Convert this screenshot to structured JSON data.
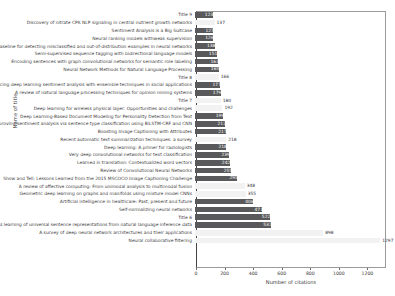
{
  "chart_data": {
    "type": "bar",
    "orientation": "horizontal",
    "title": "",
    "xlabel": "Number of citations",
    "ylabel": "Name of title",
    "xlim": [
      0,
      1330
    ],
    "xticks": [
      0,
      200,
      400,
      600,
      800,
      1000,
      1200
    ],
    "grid": false,
    "legend": null,
    "bar_colors": {
      "dark": "#59595b",
      "light": "#f2f2f2"
    },
    "categories": [
      "Discovery of nitrate CPK NLP signaling in central nutrient growth networks",
      "Sentiment Analysis is a Big Suitcase",
      "Neural ranking models withweak supervision",
      "A baseline for detecting misclassified and out-of-distribution examples in neural networks",
      "Semi-supervised sequence tagging with bidirectional language models",
      "Encoding sentences with graph convolutional networks for semantic role labeling",
      "Neural Network Methods for Natural Language Processing",
      "Title 8",
      "Enhancing deep learning sentiment analysis with ensemble techniques in social applications",
      "A review of natural language processing techniques for opinion mining systems",
      "Title 7",
      "Deep learning for wireless physical layer: Opportunities and challenges",
      "Deep Learning-Based Document Modeling for Personality Detection from Text",
      "Improving sentiment analysis via sentence type classification using BiLSTM-CRF and CNN",
      "Boosting Image Captioning with Attributes",
      "Recent automatic text summarization techniques: a survey",
      "Deep learning: A primer for radiologists",
      "Very deep convolutional networks for text classification",
      "Learned in translation: Contextualized word vectors",
      "Review of Convolutional Neural Networks",
      "Show and Tell: Lessons Learned from the 2015 MSCOCO Image Captioning Challenge",
      "A review of affective computing: From unimodal analysis to multimodal fusion",
      "Geometric deep learning on graphs and manifolds using mixture model CNNs",
      "Artificial intelligence in healthcare: Past, present and future",
      "Self-normalizing neural networks",
      "Title 6",
      "Supervised learning of universal sentence representations from natural language inference data",
      "A survey of deep neural network architectures and their applications",
      "Neural collaborative filtering"
    ],
    "values": [
      123,
      137,
      127,
      126,
      138,
      151,
      163,
      166,
      177,
      179,
      180,
      192,
      199,
      212,
      217,
      218,
      218,
      239,
      242,
      255,
      295,
      348,
      355,
      406,
      471,
      522,
      532,
      898,
      1297
    ],
    "top_label": "Title 9",
    "top_value": 123,
    "bars": [
      {
        "label": "Title 9",
        "value": 123,
        "style": "dark",
        "inside": true
      },
      {
        "label": "Discovery of nitrate CPK NLP signaling in central nutrient growth networks",
        "value": 137,
        "style": "light",
        "inside": false
      },
      {
        "label": "Sentiment Analysis is a Big Suitcase",
        "value": 127,
        "style": "dark",
        "inside": true
      },
      {
        "label": "Neural ranking models withweak supervision",
        "value": 126,
        "style": "dark",
        "inside": true
      },
      {
        "label": "A baseline for detecting misclassified and out-of-distribution examples in neural networks",
        "value": 138,
        "style": "dark",
        "inside": true
      },
      {
        "label": "Semi-supervised sequence tagging with bidirectional language models",
        "value": 151,
        "style": "dark",
        "inside": true
      },
      {
        "label": "Encoding sentences with graph convolutional networks for semantic role labeling",
        "value": 163,
        "style": "dark",
        "inside": true
      },
      {
        "label": "Neural Network Methods for Natural Language Processing",
        "value": 165,
        "style": "dark",
        "inside": true
      },
      {
        "label": "Title 8",
        "value": 166,
        "style": "light",
        "inside": false
      },
      {
        "label": "Enhancing deep learning sentiment analysis with ensemble techniques in social applications",
        "value": 177,
        "style": "dark",
        "inside": true
      },
      {
        "label": "A review of natural language processing techniques for opinion mining systems",
        "value": 179,
        "style": "dark",
        "inside": true
      },
      {
        "label": "Title 7",
        "value": 180,
        "style": "light",
        "inside": false
      },
      {
        "label": "Deep learning for wireless physical layer: Opportunities and challenges",
        "value": 192,
        "style": "light",
        "inside": false
      },
      {
        "label": "Deep Learning-Based Document Modeling for Personality Detection from Text",
        "value": 199,
        "style": "dark",
        "inside": true
      },
      {
        "label": "Improving sentiment analysis via sentence type classification using BiLSTM-CRF and CNN",
        "value": 212,
        "style": "dark",
        "inside": true
      },
      {
        "label": "Boosting Image Captioning with Attributes",
        "value": 217,
        "style": "dark",
        "inside": true
      },
      {
        "label": "Recent automatic text summarization techniques: a survey",
        "value": 218,
        "style": "light",
        "inside": false
      },
      {
        "label": "Deep learning: A primer for radiologists",
        "value": 218,
        "style": "dark",
        "inside": true
      },
      {
        "label": "Very deep convolutional networks for text classification",
        "value": 239,
        "style": "dark",
        "inside": true
      },
      {
        "label": "Learned in translation: Contextualized word vectors",
        "value": 242,
        "style": "dark",
        "inside": true
      },
      {
        "label": "Review of Convolutional Neural Networks",
        "value": 255,
        "style": "dark",
        "inside": true
      },
      {
        "label": "Show and Tell: Lessons Learned from the 2015 MSCOCO Image Captioning Challenge",
        "value": 295,
        "style": "dark",
        "inside": true
      },
      {
        "label": "A review of affective computing: From unimodal analysis to multimodal fusion",
        "value": 348,
        "style": "light",
        "inside": false
      },
      {
        "label": "Geometric deep learning on graphs and manifolds using mixture model CNNs",
        "value": 355,
        "style": "light",
        "inside": false
      },
      {
        "label": "Artificial intelligence in healthcare: Past, present and future",
        "value": 406,
        "style": "dark",
        "inside": true
      },
      {
        "label": "Self-normalizing neural networks",
        "value": 471,
        "style": "dark",
        "inside": true
      },
      {
        "label": "Title 6",
        "value": 522,
        "style": "dark",
        "inside": true
      },
      {
        "label": "Supervised learning of universal sentence representations from natural language inference data",
        "value": 532,
        "style": "dark",
        "inside": true
      },
      {
        "label": "A survey of deep neural network architectures and their applications",
        "value": 898,
        "style": "light",
        "inside": false
      },
      {
        "label": "Neural collaborative filtering",
        "value": 1297,
        "style": "light",
        "inside": false
      }
    ]
  }
}
